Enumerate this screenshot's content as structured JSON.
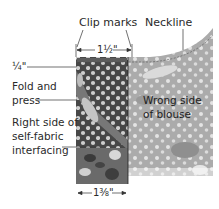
{
  "labels": {
    "clip_marks": "Clip marks",
    "neckline": "Neckline",
    "top_width": "1½\"",
    "quarter": "¼\"",
    "fold_line1": "Fold and",
    "fold_line2": "press",
    "right_side_line1": "Right side of",
    "right_side_line2": "self-fabric",
    "right_side_line3": "interfacing",
    "wrong_side_line1": "Wrong side",
    "wrong_side_line2": "of blouse",
    "bottom_width": "1⅜\""
  },
  "colors": {
    "interfacing_dark": "#4a4a4a",
    "blouse_light": "#a8a8a8",
    "dots": "#d6d6d6",
    "line": "#333333"
  }
}
